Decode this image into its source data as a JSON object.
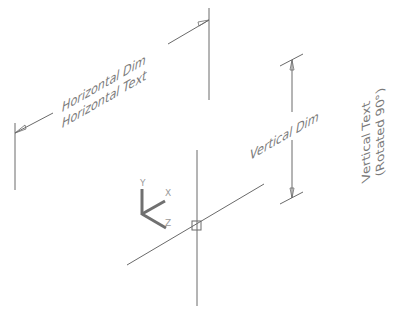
{
  "horizontal_dim": {
    "label_line1": "Horizontal Dim",
    "label_line2": "Horizontal Text"
  },
  "vertical_dim": {
    "label": "Vertical Dim"
  },
  "vertical_text": {
    "line1": "Vertical Text",
    "line2": "(Rotated 90°)"
  },
  "ucs_icon": {
    "x_label": "X",
    "y_label": "Y",
    "z_label": "Z"
  },
  "colors": {
    "line": "#6a6a6a",
    "text": "#7a7a7a",
    "ucs": "#707070",
    "background": "#ffffff"
  }
}
